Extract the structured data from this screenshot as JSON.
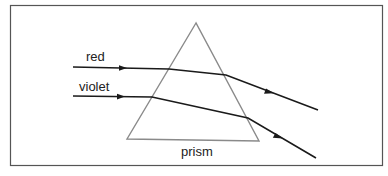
{
  "diagram": {
    "labels": {
      "red": "red",
      "violet": "violet",
      "prism": "prism"
    },
    "colors": {
      "frame": "#555555",
      "prism": "#8a8a8a",
      "ray": "#1a1a1a"
    }
  }
}
